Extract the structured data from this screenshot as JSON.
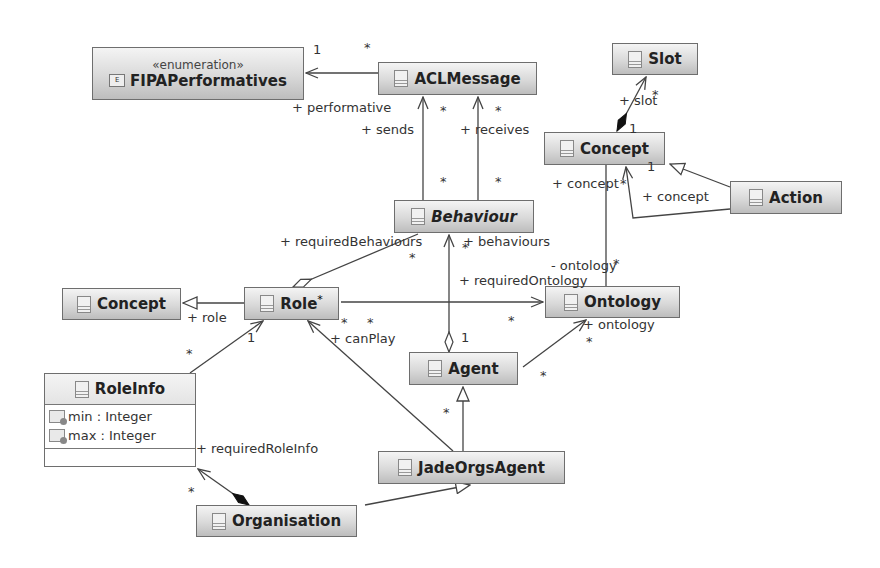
{
  "diagram": {
    "type": "UML class diagram",
    "classes": [
      {
        "id": "fipa",
        "stereotype": "«enumeration»",
        "name": "FIPAPerformatives",
        "kind": "enumeration"
      },
      {
        "id": "aclmessage",
        "name": "ACLMessage"
      },
      {
        "id": "slot",
        "name": "Slot"
      },
      {
        "id": "concept_top",
        "name": "Concept"
      },
      {
        "id": "action",
        "name": "Action"
      },
      {
        "id": "behaviour",
        "name": "Behaviour",
        "abstract": true
      },
      {
        "id": "concept_left",
        "name": "Concept"
      },
      {
        "id": "role",
        "name": "Role",
        "marker": "*"
      },
      {
        "id": "ontology",
        "name": "Ontology"
      },
      {
        "id": "agent",
        "name": "Agent"
      },
      {
        "id": "roleinfo",
        "name": "RoleInfo",
        "attributes": [
          "min : Integer",
          "max : Integer"
        ]
      },
      {
        "id": "jadeorgsagent",
        "name": "JadeOrgsAgent"
      },
      {
        "id": "organisation",
        "name": "Organisation",
        "marker": "1"
      }
    ],
    "labels": {
      "performative": "+ performative",
      "sends": "+ sends",
      "receives": "+ receives",
      "slot": "+ slot",
      "concept1": "+ concept",
      "concept2": "+ concept",
      "requiredBehaviours": "+ requiredBehaviours",
      "behaviours": "+ behaviours",
      "ontology_priv": "- ontology",
      "requiredOntology": "+ requiredOntology",
      "ontology": "+ ontology",
      "role": "+ role",
      "canPlay": "+ canPlay",
      "requiredRoleInfo": "+ requiredRoleInfo"
    },
    "multiplicities": {
      "one": "1",
      "many": "*"
    }
  }
}
